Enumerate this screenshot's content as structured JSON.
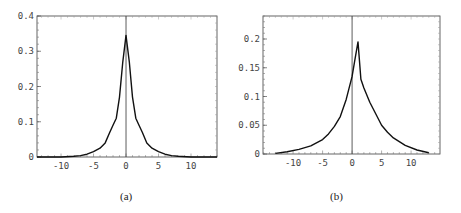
{
  "chart_data": [
    {
      "type": "line",
      "panel_label": "(a)",
      "title": "",
      "xlabel": "",
      "ylabel": "",
      "xlim": [
        -13.7,
        14
      ],
      "ylim": [
        0,
        0.4
      ],
      "x_ticks": [
        -10,
        -5,
        0,
        5,
        10
      ],
      "x_tick_labels": [
        "-10",
        "-5",
        "0",
        "5",
        "10"
      ],
      "y_ticks": [
        0,
        0.1,
        0.2,
        0.3,
        0.4
      ],
      "y_tick_labels": [
        "0",
        "0.1",
        "0.2",
        "0.3",
        "0.4"
      ],
      "grid": false,
      "vertical_line_x": 0,
      "series": [
        {
          "name": "density",
          "x": [
            -13.7,
            -10,
            -8,
            -7,
            -6,
            -5,
            -4,
            -3.2,
            -2.5,
            -2,
            -1.5,
            -1,
            -0.5,
            0,
            0.5,
            1,
            1.5,
            2,
            2.5,
            3.2,
            4,
            5,
            6,
            7,
            8,
            10,
            14
          ],
          "y": [
            0.0,
            0.0,
            0.002,
            0.004,
            0.008,
            0.015,
            0.025,
            0.04,
            0.07,
            0.09,
            0.11,
            0.17,
            0.27,
            0.345,
            0.27,
            0.17,
            0.11,
            0.09,
            0.07,
            0.04,
            0.025,
            0.015,
            0.008,
            0.004,
            0.002,
            0.0,
            0.0
          ]
        }
      ]
    },
    {
      "type": "line",
      "panel_label": "(b)",
      "title": "",
      "xlabel": "",
      "ylabel": "",
      "xlim": [
        -15.1,
        14.9
      ],
      "ylim": [
        0,
        0.24
      ],
      "x_ticks": [
        -10,
        -5,
        0,
        5,
        10
      ],
      "x_tick_labels": [
        "-10",
        "-5",
        "0",
        "5",
        "10"
      ],
      "y_ticks": [
        0,
        0.05,
        0.1,
        0.15,
        0.2
      ],
      "y_tick_labels": [
        "0",
        "0.05",
        "0.1",
        "0.15",
        "0.2"
      ],
      "grid": false,
      "vertical_line_x": 0,
      "series": [
        {
          "name": "density",
          "x": [
            -13,
            -11,
            -9,
            -7,
            -5,
            -4,
            -3,
            -2,
            -1,
            0,
            0.5,
            1,
            1.5,
            2,
            3,
            4,
            5,
            6,
            7,
            9,
            11,
            13
          ],
          "y": [
            0.001,
            0.004,
            0.008,
            0.014,
            0.025,
            0.035,
            0.048,
            0.065,
            0.095,
            0.135,
            0.165,
            0.195,
            0.13,
            0.115,
            0.09,
            0.07,
            0.05,
            0.038,
            0.028,
            0.015,
            0.007,
            0.002
          ]
        }
      ]
    }
  ],
  "panels": {
    "a": {
      "label": "(a)"
    },
    "b": {
      "label": "(b)"
    }
  }
}
